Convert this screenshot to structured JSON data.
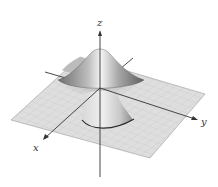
{
  "figure": {
    "axes": {
      "x_label": "x",
      "y_label": "y",
      "z_label": "z"
    },
    "colors": {
      "plane": "#dcdcdc",
      "grid": "#c4c4c4",
      "surface_light": "#f2f2f2",
      "surface_dark": "#7a7a7a",
      "axis": "#333333"
    }
  }
}
